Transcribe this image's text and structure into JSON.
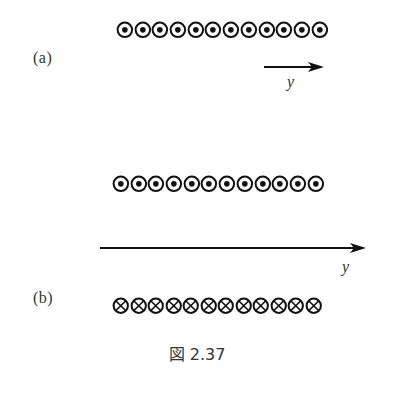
{
  "figure": {
    "caption": "図 2.37",
    "parts": [
      {
        "label": "(a)",
        "rows": [
          {
            "symbol": "out-of-page",
            "count": 12
          }
        ],
        "axis": {
          "label": "y",
          "direction": "right",
          "length": "short"
        }
      },
      {
        "label": "(b)",
        "rows": [
          {
            "symbol": "out-of-page",
            "count": 12
          },
          {
            "symbol": "into-page",
            "count": 12
          }
        ],
        "axis": {
          "label": "y",
          "direction": "right",
          "length": "long"
        }
      }
    ]
  },
  "colors": {
    "ink": "#111111",
    "background": "#ffffff"
  }
}
